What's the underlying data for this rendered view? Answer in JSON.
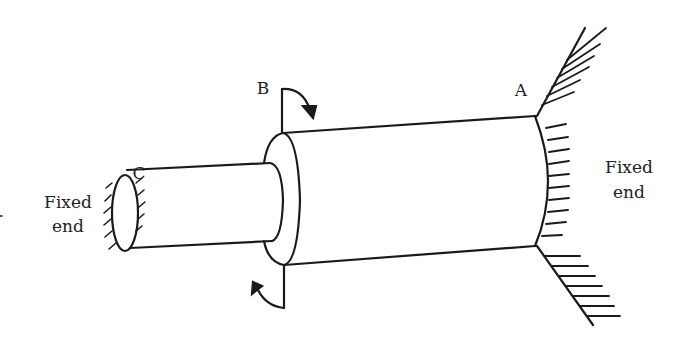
{
  "diagram": {
    "type": "stepped shaft under torsion, fixed at both ends",
    "labels": {
      "point_a": "A",
      "point_b": "B",
      "point_c": "C",
      "left_support_line1": "Fixed",
      "left_support_line2": "end",
      "right_support_line1": "Fixed",
      "right_support_line2": "end"
    },
    "elements": [
      {
        "name": "shaft-segment-CB",
        "description": "smaller diameter shaft from C to B"
      },
      {
        "name": "shaft-segment-BA",
        "description": "larger diameter shaft from B to A"
      },
      {
        "name": "torque-at-B",
        "description": "applied torque shown by curved arrows above and below B"
      },
      {
        "name": "left-fixed-support",
        "description": "hatched fixed end at C"
      },
      {
        "name": "right-fixed-support",
        "description": "hatched wall at A"
      }
    ],
    "colors": {
      "stroke": "#1a1a1a",
      "background": "#ffffff"
    }
  }
}
